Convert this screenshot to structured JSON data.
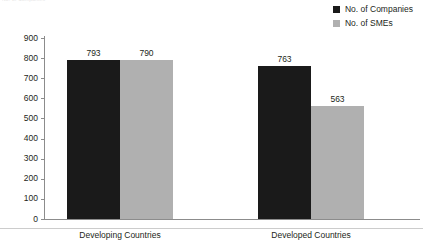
{
  "clipped_caption": "No. of Companies",
  "chart_data": {
    "type": "bar",
    "title": "",
    "xlabel": "",
    "ylabel": "",
    "ylim": [
      0,
      900
    ],
    "ytick_step": 100,
    "yticks": [
      900,
      800,
      700,
      600,
      500,
      400,
      300,
      200,
      100,
      0
    ],
    "grid": false,
    "legend_position": "top-right",
    "categories": [
      "Developing Countries",
      "Developed Countries"
    ],
    "series": [
      {
        "name": "No. of Companies",
        "color": "#1a1a1a",
        "values": [
          793,
          763
        ]
      },
      {
        "name": "No. of SMEs",
        "color": "#b0b0b0",
        "values": [
          790,
          563
        ]
      }
    ],
    "data_labels": [
      [
        "793",
        "790"
      ],
      [
        "763",
        "563"
      ]
    ]
  },
  "legend": {
    "items": [
      {
        "label": "No. of Companies",
        "color": "#1a1a1a"
      },
      {
        "label": "No. of SMEs",
        "color": "#b0b0b0"
      }
    ]
  },
  "axis": {
    "line_color": "#8c8c8c"
  }
}
